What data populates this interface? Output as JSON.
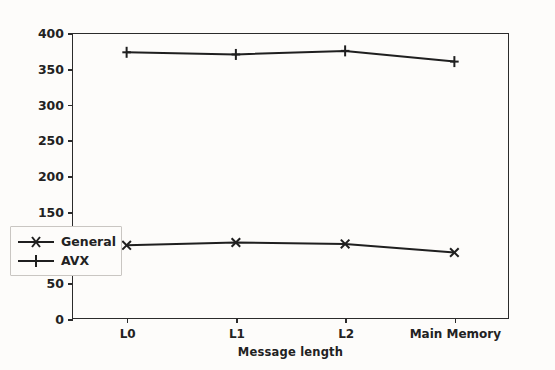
{
  "chart_data": {
    "type": "line",
    "title": "",
    "xlabel": "Message length",
    "ylabel": "MB/s",
    "categories": [
      "L0",
      "L1",
      "L2",
      "Main Memory"
    ],
    "series": [
      {
        "name": "General",
        "marker": "x",
        "color": "#1f1f1f",
        "values": [
          103,
          107,
          105,
          93
        ]
      },
      {
        "name": "AVX",
        "marker": "+",
        "color": "#1f1f1f",
        "values": [
          373,
          370,
          375,
          360
        ]
      }
    ],
    "ylim": [
      0,
      400
    ],
    "yticks": [
      0,
      50,
      100,
      150,
      200,
      250,
      300,
      350,
      400
    ],
    "ytick_labels": [
      "0",
      "50",
      "100",
      "150",
      "200",
      "250",
      "300",
      "350",
      "400"
    ],
    "xtick_labels": [
      "L0",
      "L1",
      "L2",
      "Main Memory"
    ],
    "grid": false,
    "legend_position": "lower left",
    "legend_entries": [
      "General",
      "AVX"
    ],
    "background_color": "#fdfcfa",
    "axis_color": "#2b2b2b"
  }
}
